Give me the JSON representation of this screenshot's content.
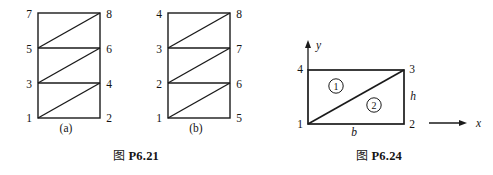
{
  "page": {
    "background_color": "#ffffff",
    "line_color": "#1a1a1a",
    "text_color": "#141414"
  },
  "figures": [
    {
      "id": "fig-a",
      "subcaption": "(a)",
      "description": "rectangle divided into three horizontal bands each split by a diagonal",
      "bands": 3,
      "left_node_labels": [
        "7",
        "5",
        "3",
        "1"
      ],
      "right_node_labels": [
        "8",
        "6",
        "4",
        "2"
      ],
      "diagonal_direction": "bottom-left-to-top-right"
    },
    {
      "id": "fig-b",
      "subcaption": "(b)",
      "description": "rectangle divided into three horizontal bands each split by a diagonal",
      "bands": 3,
      "left_node_labels": [
        "4",
        "3",
        "2",
        "1"
      ],
      "right_node_labels": [
        "8",
        "7",
        "6",
        "5"
      ],
      "diagonal_direction": "bottom-left-to-top-right"
    },
    {
      "id": "fig-c",
      "description": "single rectangle split by a diagonal into two triangular regions with coordinate axes",
      "corner_labels": {
        "bottom_left": "1",
        "bottom_right": "2",
        "top_right": "3",
        "top_left": "4"
      },
      "region_labels": [
        "1",
        "2"
      ],
      "dimension_labels": {
        "base": "b",
        "height": "h"
      },
      "axis_labels": {
        "x": "x",
        "y": "y"
      }
    }
  ],
  "captions": [
    {
      "id": "caption-1",
      "cjk": "图",
      "identifier": "P6.21"
    },
    {
      "id": "caption-2",
      "cjk": "图",
      "identifier": "P6.24"
    }
  ]
}
